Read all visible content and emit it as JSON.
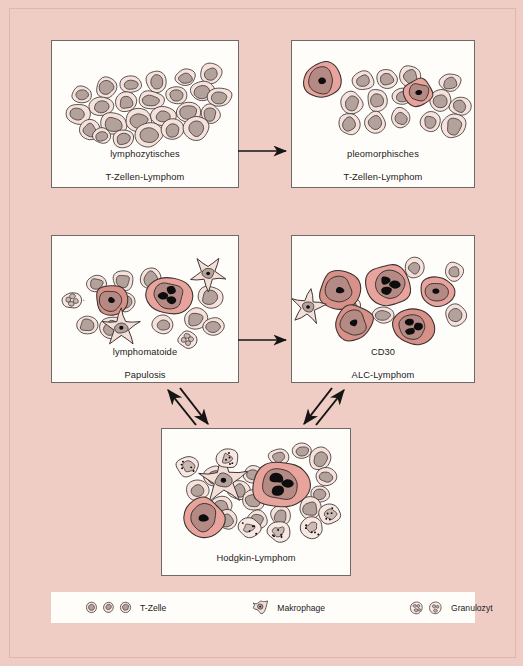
{
  "figure": {
    "title_visible": false,
    "background_color": "#efcdc4",
    "panel_background": "#fffdfa",
    "panel_border": "#6d6a67"
  },
  "palette": {
    "tumor_cytoplasm": "#e8a49c",
    "tumor_cytoplasm_dark": "#d89189",
    "tumor_nucleus": "#b58a84",
    "nucleolus": "#0d0d0d",
    "small_cell_cytoplasm": "#f6e2dc",
    "small_cell_nucleus": "#b3a19c",
    "macrophage_fill": "#f3ded8",
    "granulocyte_fill": "#f7e8e3",
    "outline": "#3a3330",
    "arrow": "#151515"
  },
  "panels": [
    {
      "id": "lymphocytic-t-cell-lymphoma",
      "label": "lymphozytisches\nT-Zellen-Lymphom",
      "label_line1": "lymphozytisches",
      "label_line2": "T-Zellen-Lymphom",
      "x": 51,
      "y": 40,
      "width": 188,
      "height": 148,
      "cell_counts": {
        "small_t_cells": 21,
        "tumor_cells": 0,
        "macrophages": 0,
        "granulocytes": 0
      }
    },
    {
      "id": "pleomorphic-t-cell-lymphoma",
      "label": "pleomorphisches\nT-Zellen-Lymphom",
      "label_line1": "pleomorphisches",
      "label_line2": "T-Zellen-Lymphom",
      "x": 291,
      "y": 40,
      "width": 184,
      "height": 148,
      "cell_counts": {
        "small_t_cells": 14,
        "tumor_cells": 2,
        "macrophages": 0,
        "granulocytes": 0
      }
    },
    {
      "id": "lymphomatoid-papulosis",
      "label": "lymphomatoide\nPapulosis",
      "label_line1": "lymphomatoide",
      "label_line2": "Papulosis",
      "x": 51,
      "y": 235,
      "width": 188,
      "height": 148,
      "cell_counts": {
        "small_t_cells": 11,
        "tumor_cells": 2,
        "macrophages": 3,
        "granulocytes": 2
      }
    },
    {
      "id": "cd30-alc-lymphoma",
      "label": "CD30\nALC-Lymphom",
      "label_line1": "CD30",
      "label_line2": "ALC-Lymphom",
      "x": 291,
      "y": 235,
      "width": 184,
      "height": 148,
      "cell_counts": {
        "small_t_cells": 5,
        "tumor_cells": 6,
        "macrophages": 1,
        "granulocytes": 0
      }
    },
    {
      "id": "hodgkin-lymphoma",
      "label": "Hodgkin-Lymphom",
      "label_line1": "Hodgkin-Lymphom",
      "label_line2": "",
      "x": 161,
      "y": 428,
      "width": 190,
      "height": 148,
      "cell_counts": {
        "small_t_cells": 16,
        "tumor_cells": 2,
        "macrophages": 1,
        "granulocytes": 6
      }
    }
  ],
  "arrows": [
    {
      "id": "arrow-lymphocytic-to-pleomorphic",
      "type": "single",
      "from": "lymphocytic-t-cell-lymphoma",
      "to": "pleomorphic-t-cell-lymphoma",
      "direction": "right"
    },
    {
      "id": "arrow-papulosis-to-cd30",
      "type": "single",
      "from": "lymphomatoid-papulosis",
      "to": "cd30-alc-lymphoma",
      "direction": "right"
    },
    {
      "id": "arrow-papulosis-hodgkin",
      "type": "double",
      "from": "lymphomatoid-papulosis",
      "to": "hodgkin-lymphoma",
      "direction": "bidirectional"
    },
    {
      "id": "arrow-cd30-hodgkin",
      "type": "double",
      "from": "cd30-alc-lymphoma",
      "to": "hodgkin-lymphoma",
      "direction": "bidirectional"
    }
  ],
  "legend": {
    "items": [
      {
        "id": "t-zelle",
        "label": "T-Zelle",
        "icon_count": 3,
        "icon_name": "t-cell-icon"
      },
      {
        "id": "makrophage",
        "label": "Makrophage",
        "icon_count": 1,
        "icon_name": "macrophage-icon"
      },
      {
        "id": "granulozyt",
        "label": "Granulozyt",
        "icon_count": 2,
        "icon_name": "granulocyte-icon"
      }
    ]
  }
}
